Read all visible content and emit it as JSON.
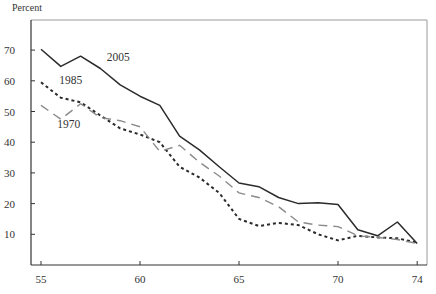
{
  "chart_data": {
    "type": "line",
    "title": "",
    "xlabel": "",
    "ylabel": "Percent",
    "xlim": [
      54.5,
      74.5
    ],
    "ylim": [
      0,
      78
    ],
    "x_ticks": [
      55,
      60,
      65,
      70,
      74
    ],
    "x_tick_labels": [
      "55",
      "60",
      "65",
      "70",
      "74"
    ],
    "y_ticks": [
      10,
      20,
      30,
      40,
      50,
      60,
      70
    ],
    "y_tick_labels": [
      "10",
      "20",
      "30",
      "40",
      "50",
      "60",
      "70"
    ],
    "grid": false,
    "legend": "inline-labels",
    "x": [
      55,
      56,
      57,
      58,
      59,
      60,
      61,
      62,
      63,
      64,
      65,
      66,
      67,
      68,
      69,
      70,
      71,
      72,
      73,
      74
    ],
    "series": [
      {
        "name": "2005",
        "label": "2005",
        "style": "solid",
        "color": "#2b2b2b",
        "label_anchor": {
          "x": 58.9,
          "y": 66.5
        },
        "values": [
          70.3,
          64.7,
          68.0,
          64.0,
          58.7,
          55.0,
          52.0,
          42.0,
          37.5,
          32.0,
          26.7,
          25.5,
          22.0,
          20.0,
          20.3,
          19.7,
          11.5,
          9.5,
          14.0,
          7.0
        ]
      },
      {
        "name": "1985",
        "label": "1985",
        "style": "dotted",
        "color": "#2b2b2b",
        "label_anchor": {
          "x": 56.5,
          "y": 59.0
        },
        "values": [
          59.5,
          54.5,
          53.0,
          48.7,
          44.5,
          42.5,
          40.0,
          32.0,
          28.5,
          23.5,
          15.0,
          12.7,
          13.7,
          13.0,
          10.0,
          8.0,
          9.5,
          9.0,
          8.7,
          7.3
        ]
      },
      {
        "name": "1970",
        "label": "1970",
        "style": "dashed",
        "color": "#8a8a8a",
        "label_anchor": {
          "x": 56.4,
          "y": 44.5
        },
        "values": [
          52.0,
          47.5,
          52.5,
          48.0,
          47.0,
          45.0,
          37.0,
          39.0,
          33.5,
          29.0,
          23.5,
          22.0,
          19.0,
          14.0,
          13.0,
          12.5,
          9.5,
          9.0,
          8.3,
          7.0
        ]
      }
    ]
  }
}
